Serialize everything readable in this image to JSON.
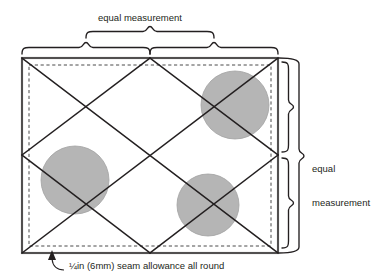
{
  "diagram": {
    "labels": {
      "top_measurement": "equal measurement",
      "right_measurement_line1": "equal",
      "right_measurement_line2": "measurement",
      "seam_allowance_caption": "¼in (6mm) seam allowance all round"
    },
    "colors": {
      "stroke": "#231f20",
      "circle_fill": "#b5b5b5",
      "circle_stroke": "#9a9a9a",
      "panel_edge": "#8c8c8c",
      "panel_fill": "#ffffff",
      "dashed_guide": "#555555",
      "text": "#231f20"
    },
    "geometry": {
      "panel": {
        "x": 22,
        "y": 58,
        "width": 256,
        "height": 195
      },
      "seam_inset": 7,
      "diamond_vertices": {
        "top_apex": {
          "x": 150,
          "y": 58
        },
        "bottom_apex": {
          "x": 150,
          "y": 253
        },
        "left_vertex": {
          "x": 22,
          "y": 155
        },
        "right_vertex": {
          "x": 278,
          "y": 155
        },
        "center": {
          "x": 150,
          "y": 155
        }
      },
      "circles": [
        {
          "name": "circle-top-right",
          "cx": 235,
          "cy": 105,
          "r": 34
        },
        {
          "name": "circle-left",
          "cx": 75,
          "cy": 180,
          "r": 34
        },
        {
          "name": "circle-bottom-center",
          "cx": 208,
          "cy": 205,
          "r": 31
        }
      ],
      "arrow_tip": {
        "x": 52,
        "y": 252
      }
    },
    "braces": {
      "top_outer": {
        "x1": 150,
        "x2": 278,
        "y": 44
      },
      "top_left_lower": {
        "x1": 22,
        "x2": 150,
        "y": 50
      },
      "top_center_upper": {
        "x1": 86,
        "x2": 214,
        "y": 30
      },
      "right_outer": {
        "y1": 58,
        "y2": 253,
        "x": 296
      },
      "right_upper": {
        "y1": 62,
        "y2": 155,
        "x": 286
      },
      "right_lower": {
        "y1": 155,
        "y2": 248,
        "x": 286
      }
    }
  }
}
